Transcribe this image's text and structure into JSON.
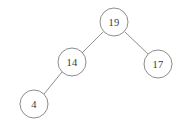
{
  "diagram": {
    "background_color": "#ffffff",
    "node_stroke_color": "#8d8d8d",
    "edge_stroke_color": "#8f8f8f",
    "label_color": "#3a3a3a",
    "width": 179,
    "height": 126,
    "node_radius": 14,
    "nodes": [
      {
        "id": "n19",
        "label": "19",
        "cx": 114,
        "cy": 22,
        "role": "root"
      },
      {
        "id": "n14",
        "label": "14",
        "cx": 72,
        "cy": 62,
        "role": "left-child"
      },
      {
        "id": "n17",
        "label": "17",
        "cx": 158,
        "cy": 64,
        "role": "right-child"
      },
      {
        "id": "n4",
        "label": "4",
        "cx": 34,
        "cy": 104,
        "role": "left-leaf"
      }
    ],
    "edges": [
      {
        "id": "e19-14",
        "from": "19",
        "to": "14",
        "x1": 103,
        "y1": 32,
        "x2": 82,
        "y2": 53
      },
      {
        "id": "e19-17",
        "from": "19",
        "to": "17",
        "x1": 125,
        "y1": 32,
        "x2": 148,
        "y2": 54
      },
      {
        "id": "e14-4",
        "from": "14",
        "to": "4",
        "x1": 62,
        "y1": 72,
        "x2": 44,
        "y2": 94
      }
    ]
  }
}
